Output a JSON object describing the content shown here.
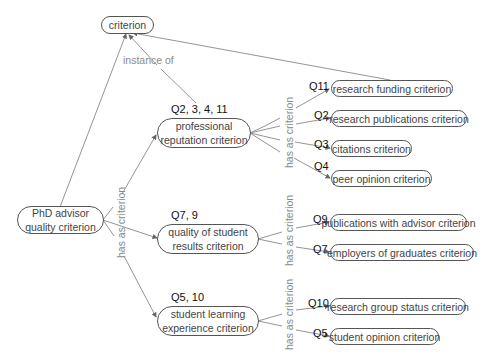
{
  "diagram": {
    "root": {
      "label": "criterion"
    },
    "main": {
      "label": "PhD advisor quality criterion",
      "line1": "PhD advisor",
      "line2": "quality criterion"
    },
    "relations": {
      "instance_of": "instance of",
      "has_as_criterion": "has as criterion"
    },
    "groups": [
      {
        "label_line1": "professional",
        "label_line2": "reputation criterion",
        "questions": "Q2, 3, 4, 11",
        "children": [
          {
            "q": "Q11",
            "label": "research funding criterion"
          },
          {
            "q": "Q2",
            "label": "research publications criterion"
          },
          {
            "q": "Q3",
            "label": "citations criterion"
          },
          {
            "q": "Q4",
            "label": "peer opinion criterion"
          }
        ]
      },
      {
        "label_line1": "quality of student",
        "label_line2": "results criterion",
        "questions": "Q7, 9",
        "children": [
          {
            "q": "Q9",
            "label": "publications with advisor criterion"
          },
          {
            "q": "Q7",
            "label": "employers of graduates criterion"
          }
        ]
      },
      {
        "label_line1": "student learning",
        "label_line2": "experience criterion",
        "questions": "Q5, 10",
        "children": [
          {
            "q": "Q10",
            "label": "research group status criterion"
          },
          {
            "q": "Q5",
            "label": "student opinion criterion"
          }
        ]
      }
    ],
    "colors": {
      "edge": "#777777",
      "relation_text": "#8a8a8a",
      "node_border": "#555555",
      "node_text": "#444444",
      "q_text": "#111111"
    }
  }
}
